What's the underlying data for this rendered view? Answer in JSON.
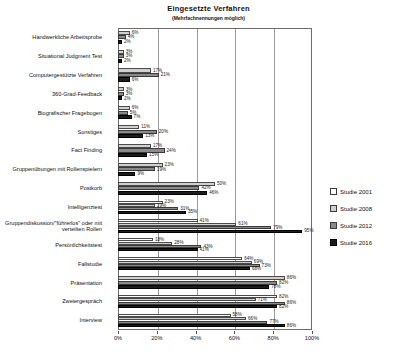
{
  "chart_data": {
    "type": "bar",
    "orientation": "horizontal",
    "title": "Eingesetzte Verfahren",
    "subtitle": "(Mehrfachnennungen möglich)",
    "xlabel": "",
    "ylabel": "",
    "xlim": [
      0,
      100
    ],
    "xticks": [
      0,
      20,
      40,
      60,
      80,
      100
    ],
    "xtick_labels": [
      "0%",
      "20%",
      "40%",
      "60%",
      "80%",
      "100%"
    ],
    "grid": true,
    "legend_position": "right",
    "value_suffix": "%",
    "categories": [
      "Handwerkliche Arbeitsprobe",
      "Situational Judgment Test",
      "Computergestützte Verfahren",
      "360-Grad-Feedback",
      "Biografischer Fragebogen",
      "Sonstiges",
      "Fact Finding",
      "Gruppenübungen mit Rollenspielern",
      "Postkorb",
      "Intelligenztest",
      "Gruppendiskussion/\"führerlos\" oder mit verteilten Rollen",
      "Persönlichkeitstest",
      "Fallstudie",
      "Präsentation",
      "Zweiergespräch",
      "Interview"
    ],
    "series": [
      {
        "name": "Studie 2001",
        "color": "#ffffff",
        "values": [
          null,
          null,
          null,
          null,
          null,
          null,
          null,
          null,
          null,
          23,
          41,
          18,
          64,
          null,
          82,
          58
        ]
      },
      {
        "name": "Studie 2008",
        "color": "#d0d0d0",
        "values": [
          6,
          3,
          17,
          3,
          6,
          11,
          17,
          23,
          50,
          19,
          61,
          28,
          69,
          86,
          71,
          66
        ]
      },
      {
        "name": "Studie 2012",
        "color": "#8a8a8a",
        "values": [
          4,
          3,
          21,
          3,
          5,
          20,
          24,
          19,
          42,
          31,
          79,
          43,
          73,
          82,
          86,
          77
        ]
      },
      {
        "name": "Studie 2016",
        "color": "#1c1c1c",
        "values": [
          2,
          2,
          6,
          2,
          7,
          13,
          15,
          9,
          46,
          35,
          95,
          41,
          68,
          78,
          82,
          86
        ]
      }
    ]
  },
  "legend": {
    "items": [
      {
        "label": "Studie 2001",
        "key": "s2001"
      },
      {
        "label": "Studie 2008",
        "key": "s2008"
      },
      {
        "label": "Studie 2012",
        "key": "s2012"
      },
      {
        "label": "Studie 2016",
        "key": "s2016"
      }
    ]
  }
}
